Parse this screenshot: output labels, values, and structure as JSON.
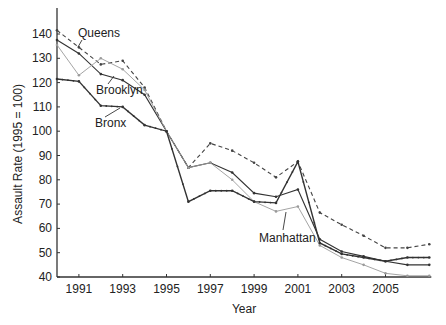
{
  "chart_data": {
    "type": "line",
    "title": "",
    "xlabel": "Year",
    "ylabel": "Assault Rate (1995 = 100)",
    "x": [
      1990,
      1991,
      1992,
      1993,
      1994,
      1995,
      1996,
      1997,
      1998,
      1999,
      2000,
      2001,
      2002,
      2003,
      2004,
      2005,
      2006,
      2007
    ],
    "xlim": [
      1990,
      2007
    ],
    "ylim": [
      40,
      145
    ],
    "x_ticks": [
      1991,
      1993,
      1995,
      1997,
      1999,
      2001,
      2003,
      2005
    ],
    "y_ticks": [
      40,
      50,
      60,
      70,
      80,
      90,
      100,
      110,
      120,
      130,
      140
    ],
    "grid": false,
    "legend": "inline-labels",
    "series": [
      {
        "name": "Queens",
        "style": "dashed",
        "color": "#444444",
        "values": [
          141.5,
          134.5,
          127.5,
          129,
          118,
          100,
          85,
          95,
          92,
          87,
          81,
          87.5,
          66.5,
          61.5,
          57,
          52,
          52,
          53.5
        ]
      },
      {
        "name": "Brooklyn",
        "style": "solid",
        "color": "#333333",
        "values": [
          137.5,
          132,
          123.5,
          121,
          115,
          100,
          85,
          87,
          83,
          74.5,
          73,
          76,
          55.5,
          50.5,
          48.5,
          46.5,
          45,
          45
        ]
      },
      {
        "name": "Manhattan",
        "style": "solid-light",
        "color": "#9a9a9a",
        "values": [
          135.5,
          123,
          130,
          125.5,
          117,
          100,
          85,
          87,
          80,
          71,
          67,
          69,
          53,
          48,
          45,
          41.5,
          40.5,
          40.5
        ]
      },
      {
        "name": "Bronx",
        "style": "solid-markers",
        "color": "#333333",
        "values": [
          121.5,
          120.5,
          110.5,
          110,
          102.5,
          100,
          71,
          75.5,
          75.5,
          71,
          70.5,
          87.5,
          54,
          49.5,
          48,
          46.5,
          48,
          48
        ]
      }
    ],
    "annotations": [
      {
        "text": "Queens",
        "x": 78,
        "y": 37,
        "leader": [
          82,
          40,
          78,
          47
        ]
      },
      {
        "text": "Brooklyn",
        "x": 96,
        "y": 94,
        "leader": [
          108,
          84,
          114,
          76
        ]
      },
      {
        "text": "Bronx",
        "x": 95,
        "y": 127,
        "leader": [
          105,
          117,
          120,
          108
        ]
      },
      {
        "text": "Manhattan",
        "x": 259,
        "y": 242,
        "leader": [
          283,
          230,
          286,
          212
        ]
      }
    ]
  }
}
